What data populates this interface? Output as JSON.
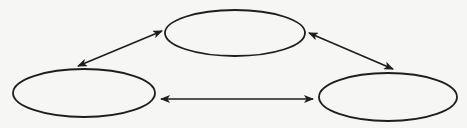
{
  "diagram": {
    "type": "cycle",
    "colors": {
      "background": "#f6f6f5",
      "stroke": "#1e1e1e"
    },
    "nodes": [
      {
        "id": "top",
        "label": "",
        "cx": 235,
        "cy": 33,
        "rx": 70,
        "ry": 23
      },
      {
        "id": "left",
        "label": "",
        "cx": 84,
        "cy": 93,
        "rx": 71,
        "ry": 24
      },
      {
        "id": "right",
        "label": "",
        "cx": 388,
        "cy": 97,
        "rx": 69,
        "ry": 24
      }
    ],
    "edges": [
      {
        "from": "left",
        "to": "top",
        "direction": "both",
        "x1": 78,
        "y1": 66,
        "x2": 162,
        "y2": 31
      },
      {
        "from": "top",
        "to": "right",
        "direction": "both",
        "x1": 309,
        "y1": 33,
        "x2": 393,
        "y2": 69
      },
      {
        "from": "left",
        "to": "right",
        "direction": "both",
        "x1": 161,
        "y1": 99,
        "x2": 313,
        "y2": 99
      }
    ]
  }
}
